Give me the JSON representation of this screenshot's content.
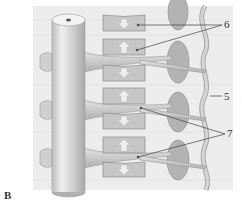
{
  "figure": {
    "panel_label": "B",
    "labels": {
      "six": "6",
      "five": "5",
      "seven": "7"
    },
    "parts": {
      "trunk": "cylindrical trunk",
      "blocks": "rectangular blocks with arrows",
      "ovals": "oval bodies",
      "membrane": "wavy membrane",
      "branches": "tapering branches"
    },
    "colors": {
      "background_panel": "#eeeeee",
      "trunk_light": "#f2f2f2",
      "trunk_dark": "#b8b8b8",
      "block_fill": "#c4c4c4",
      "block_stroke": "#8a8a8a",
      "oval_fill": "#b5b5b5",
      "membrane": "#c8c8c8",
      "leader_line": "#444444"
    }
  }
}
